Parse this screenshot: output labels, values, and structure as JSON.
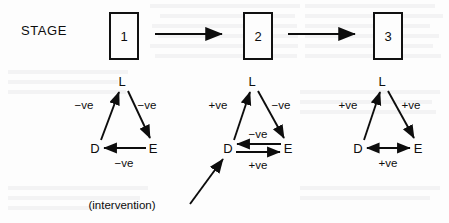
{
  "figure": {
    "stage_label": "STAGE",
    "intervention_label": "(intervention)",
    "stages": [
      {
        "number": "1",
        "box_x": 109
      },
      {
        "number": "2",
        "box_x": 243
      },
      {
        "number": "3",
        "box_x": 373
      }
    ],
    "flow_arrows": [
      {
        "from": "1",
        "to": "2"
      },
      {
        "from": "2",
        "to": "3"
      }
    ],
    "triangles": [
      {
        "stage": "1",
        "nodes": {
          "top": "L",
          "left": "D",
          "right": "E"
        },
        "edges": [
          {
            "from": "D",
            "to": "L",
            "sign": "−ve",
            "label_x": 84,
            "label_y": 105
          },
          {
            "from": "L",
            "to": "E",
            "sign": "−ve",
            "label_x": 147,
            "label_y": 105
          },
          {
            "from": "E",
            "to": "D",
            "sign": "−ve",
            "label_x": 124,
            "label_y": 163
          }
        ]
      },
      {
        "stage": "2",
        "nodes": {
          "top": "L",
          "left": "D",
          "right": "E"
        },
        "edges": [
          {
            "from": "D",
            "to": "L",
            "sign": "+ve",
            "label_x": 218,
            "label_y": 105
          },
          {
            "from": "L",
            "to": "E",
            "sign": "−ve",
            "label_x": 281,
            "label_y": 105
          },
          {
            "from": "E",
            "to": "D",
            "sign": "−ve",
            "label_x": 258,
            "label_y": 135
          },
          {
            "from": "D",
            "to": "E",
            "sign": "+ve",
            "label_x": 258,
            "label_y": 165
          }
        ]
      },
      {
        "stage": "3",
        "nodes": {
          "top": "L",
          "left": "D",
          "right": "E"
        },
        "edges": [
          {
            "from": "D",
            "to": "L",
            "sign": "+ve",
            "label_x": 348,
            "label_y": 105
          },
          {
            "from": "L",
            "to": "E",
            "sign": "+ve",
            "label_x": 411,
            "label_y": 105
          },
          {
            "from": "D",
            "to": "E",
            "sign": "+ve",
            "label_x": 388,
            "label_y": 163,
            "bidirectional": true
          }
        ]
      }
    ],
    "node_positions": [
      {
        "stage": "1",
        "name": "L",
        "x": 122,
        "y": 81
      },
      {
        "stage": "1",
        "name": "D",
        "x": 95,
        "y": 148
      },
      {
        "stage": "1",
        "name": "E",
        "x": 153,
        "y": 148
      },
      {
        "stage": "2",
        "name": "L",
        "x": 252,
        "y": 81
      },
      {
        "stage": "2",
        "name": "D",
        "x": 228,
        "y": 148
      },
      {
        "stage": "2",
        "name": "E",
        "x": 288,
        "y": 148
      },
      {
        "stage": "3",
        "name": "L",
        "x": 382,
        "y": 81
      },
      {
        "stage": "3",
        "name": "D",
        "x": 358,
        "y": 148
      },
      {
        "stage": "3",
        "name": "E",
        "x": 418,
        "y": 148
      }
    ],
    "colors": {
      "ink": "#0d0d0d",
      "paper": "#fdfdfd"
    }
  }
}
